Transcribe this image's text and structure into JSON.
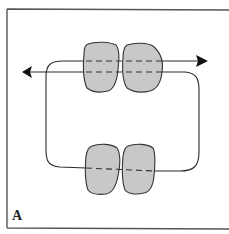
{
  "figure": {
    "panel_label": "A",
    "colors": {
      "frame": "#555555",
      "line": "#2a2a2a",
      "blob_fill": "#c8c8c8",
      "blob_stroke": "#333333",
      "arrow": "#111111",
      "background": "#ffffff"
    },
    "elements": {
      "top_pair": "two-shaded-subunits-crossed-by-two-dashed-strands",
      "bottom_pair": "two-shaded-subunits-crossed-by-one-dashed-strand",
      "loop": "continuous-strand-loop-connecting-top-and-bottom-pairs",
      "arrows": [
        "left-arrow",
        "right-arrow"
      ]
    }
  }
}
